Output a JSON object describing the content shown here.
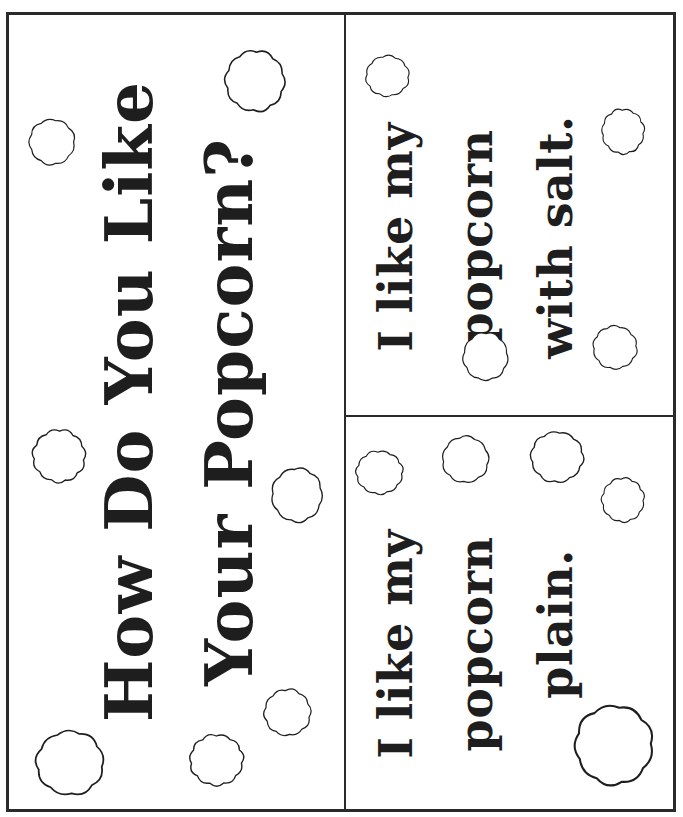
{
  "page": {
    "top_cutoff_text": "",
    "colors": {
      "ink": "#1e1e1e",
      "border": "#2a2a2a",
      "paper": "#ffffff"
    }
  },
  "title_card": {
    "line1": "How Do You Like",
    "line2": "Your Popcorn?"
  },
  "salt_card": {
    "line1": "I like my",
    "line2": "popcorn",
    "line3": "with salt."
  },
  "plain_card": {
    "line1": "I like my",
    "line2": "popcorn",
    "line3": "plain."
  },
  "decorations": {
    "icon": "popcorn-puff-icon",
    "puffs": [
      {
        "x": 25,
        "y": 115,
        "w": 54,
        "h": 54
      },
      {
        "x": 220,
        "y": 45,
        "w": 70,
        "h": 72
      },
      {
        "x": 28,
        "y": 425,
        "w": 62,
        "h": 62
      },
      {
        "x": 267,
        "y": 463,
        "w": 60,
        "h": 64
      },
      {
        "x": 260,
        "y": 685,
        "w": 55,
        "h": 55
      },
      {
        "x": 185,
        "y": 730,
        "w": 63,
        "h": 60
      },
      {
        "x": 30,
        "y": 725,
        "w": 80,
        "h": 76
      },
      {
        "x": 362,
        "y": 52,
        "w": 51,
        "h": 48
      },
      {
        "x": 598,
        "y": 105,
        "w": 50,
        "h": 53
      },
      {
        "x": 459,
        "y": 328,
        "w": 53,
        "h": 57
      },
      {
        "x": 589,
        "y": 322,
        "w": 52,
        "h": 51
      },
      {
        "x": 352,
        "y": 447,
        "w": 55,
        "h": 51
      },
      {
        "x": 438,
        "y": 432,
        "w": 55,
        "h": 55
      },
      {
        "x": 526,
        "y": 427,
        "w": 62,
        "h": 60
      },
      {
        "x": 598,
        "y": 474,
        "w": 50,
        "h": 52
      },
      {
        "x": 568,
        "y": 698,
        "w": 92,
        "h": 94
      }
    ]
  }
}
